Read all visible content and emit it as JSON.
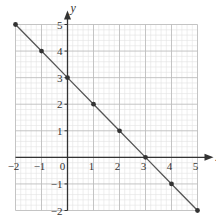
{
  "chart_data": {
    "type": "line",
    "title": "",
    "xlabel": "x",
    "ylabel": "y",
    "xlim": [
      -2,
      5
    ],
    "ylim": [
      -2,
      5
    ],
    "grid": true,
    "minor_grid_per_unit": 5,
    "x_ticks": [
      -2,
      -1,
      0,
      1,
      2,
      3,
      4,
      5
    ],
    "y_ticks": [
      -2,
      -1,
      1,
      2,
      3,
      4,
      5
    ],
    "x_tick_labels": [
      "−2",
      "−1",
      "0",
      "1",
      "2",
      "3",
      "4",
      "5"
    ],
    "y_tick_labels": [
      "−2",
      "−1",
      "1",
      "2",
      "3",
      "4",
      "5"
    ],
    "series": [
      {
        "name": "y = 3 − x",
        "x": [
          -2,
          -1,
          0,
          1,
          2,
          3,
          4,
          5
        ],
        "y": [
          5,
          4,
          3,
          2,
          1,
          0,
          -1,
          -2
        ],
        "color": "#555555",
        "markers": true
      }
    ],
    "legend": null
  },
  "colors": {
    "axis": "#333333",
    "major_grid": "#bdbdbd",
    "minor_grid": "#e3e3e3",
    "line": "#555555",
    "marker": "#333333"
  }
}
